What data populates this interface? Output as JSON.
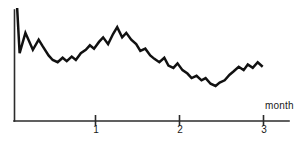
{
  "chart_data": {
    "type": "line",
    "title": "",
    "xlabel": "month",
    "ylabel": "",
    "xlim": [
      0,
      3.2
    ],
    "ylim": [
      0,
      100
    ],
    "grid": false,
    "legend": null,
    "x_ticks": [
      {
        "value": 1,
        "label": "1"
      },
      {
        "value": 2,
        "label": "2"
      },
      {
        "value": 3,
        "label": "3"
      }
    ],
    "y_ticks": [],
    "series": [
      {
        "name": "value",
        "x": [
          0.02,
          0.05,
          0.12,
          0.21,
          0.28,
          0.33,
          0.4,
          0.45,
          0.51,
          0.57,
          0.62,
          0.68,
          0.73,
          0.79,
          0.85,
          0.9,
          0.95,
          1.01,
          1.06,
          1.12,
          1.18,
          1.23,
          1.29,
          1.34,
          1.4,
          1.46,
          1.51,
          1.57,
          1.63,
          1.68,
          1.74,
          1.8,
          1.85,
          1.91,
          1.96,
          2.02,
          2.08,
          2.13,
          2.19,
          2.25,
          2.3,
          2.36,
          2.42,
          2.47,
          2.53,
          2.59,
          2.64,
          2.7,
          2.76,
          2.81,
          2.87,
          2.93,
          2.99
        ],
        "y": [
          100,
          60,
          78,
          63,
          72,
          66,
          58,
          54,
          52,
          56,
          53,
          57,
          54,
          60,
          63,
          67,
          64,
          70,
          74,
          68,
          77,
          83,
          74,
          78,
          72,
          68,
          62,
          64,
          58,
          55,
          52,
          56,
          49,
          47,
          51,
          45,
          42,
          38,
          40,
          36,
          38,
          33,
          31,
          34,
          36,
          41,
          44,
          48,
          45,
          50,
          47,
          52,
          48
        ]
      }
    ]
  },
  "axes": {
    "x_axis_title": "month",
    "tick_labels": [
      "1",
      "2",
      "3"
    ]
  },
  "style": {
    "line_color": "#111111",
    "axis_color": "#2b2b2b",
    "background": "#ffffff"
  }
}
